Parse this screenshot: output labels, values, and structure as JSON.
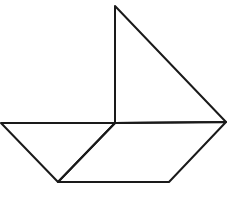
{
  "diagram": {
    "stroke_color": "#1a1a1a",
    "background": "#ffffff",
    "shapes": [
      {
        "name": "sail-triangle",
        "points": "115,6 115,123 226,122"
      },
      {
        "name": "left-hull-triangle",
        "points": "1,123 115,123 58,182"
      },
      {
        "name": "right-hull-parallelogram",
        "points": "115,123 226,122 169,182 58,182"
      }
    ]
  }
}
